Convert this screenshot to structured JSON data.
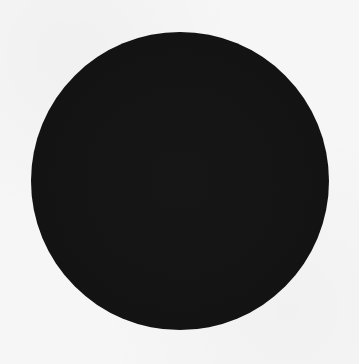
{
  "canvas": {
    "width": 359,
    "height": 364,
    "background_color": "#f6f6f6"
  },
  "shape": {
    "type": "circle",
    "fill_color": "#141414",
    "center_x": 180,
    "center_y": 181,
    "diameter": 298
  }
}
